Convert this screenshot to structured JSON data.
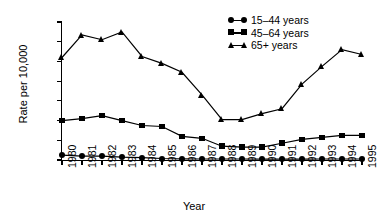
{
  "chart_data": {
    "type": "line",
    "title": "",
    "xlabel": "Year",
    "ylabel": "Rate per 10,000",
    "x": [
      1980,
      1981,
      1982,
      1983,
      1984,
      1985,
      1986,
      1987,
      1988,
      1989,
      1990,
      1991,
      1992,
      1993,
      1994,
      1995
    ],
    "categories": [
      "1980",
      "1981",
      "1982",
      "1983",
      "1984",
      "1985",
      "1986",
      "1987",
      "1988",
      "1989",
      "1990",
      "1991",
      "1992",
      "1993",
      "1994",
      "1995"
    ],
    "xlim": [
      1980,
      1995
    ],
    "ylim": [
      0,
      140
    ],
    "yticks": [
      0,
      20,
      40,
      60,
      80,
      100,
      120,
      140
    ],
    "ytick_labels": [
      "0",
      "20",
      "40",
      "60",
      "80",
      "100",
      "120",
      "140"
    ],
    "grid": false,
    "legend_position": "top-right",
    "series": [
      {
        "name": "15–44 years",
        "marker": "circle",
        "values": [
          5,
          4,
          4,
          3,
          2.5,
          1.5,
          1.2,
          1,
          1,
          1,
          0.8,
          0.8,
          0.8,
          1,
          1,
          1
        ]
      },
      {
        "name": "45–64 years",
        "marker": "square",
        "values": [
          40,
          42,
          45,
          40,
          35,
          34,
          24,
          22,
          14,
          13,
          13,
          17,
          21,
          23,
          25,
          25
        ]
      },
      {
        "name": "65+ years",
        "marker": "triangle",
        "values": [
          104,
          127,
          122,
          130,
          105,
          98,
          89,
          66,
          41,
          41,
          47,
          52,
          77,
          95,
          112,
          107
        ]
      }
    ]
  },
  "legend": {
    "items": [
      {
        "label": "15–44 years",
        "marker": "circle"
      },
      {
        "label": "45–64 years",
        "marker": "square"
      },
      {
        "label": "65+ years",
        "marker": "triangle"
      }
    ]
  },
  "colors": {
    "line": "#000000",
    "background": "#ffffff",
    "axis": "#000000"
  }
}
